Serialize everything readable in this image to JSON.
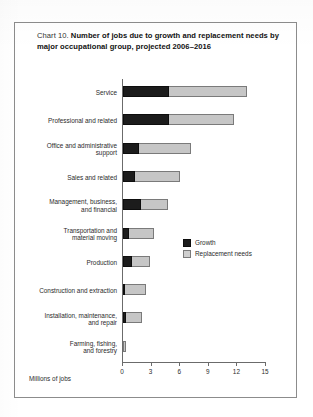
{
  "title": {
    "prefix": "Chart 10. ",
    "main": "Number of jobs due to growth and replacement needs by major occupational group, projected 2006–2016"
  },
  "legend": {
    "growth_label": "Growth",
    "replacement_label": "Replacement needs",
    "growth_color": "#1c1c1c",
    "replacement_color": "#c6c6c6",
    "position": "inside-right-middle"
  },
  "axis": {
    "x_title": "Millions of jobs",
    "ticks": [
      "0",
      "3",
      "6",
      "9",
      "12",
      "15"
    ]
  },
  "chart_data": {
    "type": "bar",
    "orientation": "horizontal",
    "stacked": true,
    "title": "Chart 10. Number of jobs due to growth and replacement needs by major occupational group, projected 2006–2016",
    "xlabel": "Millions of jobs",
    "ylabel": "",
    "xlim": [
      0,
      15
    ],
    "xticks": [
      0,
      3,
      6,
      9,
      12,
      15
    ],
    "grid": false,
    "legend_position": "inside-right-middle",
    "categories": [
      "Service",
      "Professional and related",
      "Office and administrative support",
      "Sales and related",
      "Management, business, and financial",
      "Transportation and material moving",
      "Production",
      "Construction and extraction",
      "Installation, maintenance, and repair",
      "Farming, fishing, and forestry"
    ],
    "series": [
      {
        "name": "Growth",
        "color": "#1c1c1c",
        "values": [
          4.8,
          4.8,
          1.7,
          1.3,
          1.9,
          0.6,
          0.9,
          0.1,
          0.3,
          0.0
        ]
      },
      {
        "name": "Replacement needs",
        "color": "#c6c6c6",
        "values": [
          8.2,
          6.8,
          5.4,
          4.7,
          2.8,
          2.7,
          1.9,
          2.2,
          1.7,
          0.3
        ]
      }
    ],
    "totals": [
      13.0,
      11.6,
      7.1,
      6.0,
      4.7,
      3.3,
      2.8,
      2.3,
      2.0,
      0.3
    ]
  },
  "rows": [
    {
      "label": "Service"
    },
    {
      "label": "Professional and related"
    },
    {
      "label": "Office and administrative\nsupport"
    },
    {
      "label": "Sales and related"
    },
    {
      "label": "Management, business,\nand financial"
    },
    {
      "label": "Transportation and\nmaterial moving"
    },
    {
      "label": "Production"
    },
    {
      "label": "Construction and extraction"
    },
    {
      "label": "Installation, maintenance,\nand repair"
    },
    {
      "label": "Farming, fishing,\nand forestry"
    }
  ]
}
